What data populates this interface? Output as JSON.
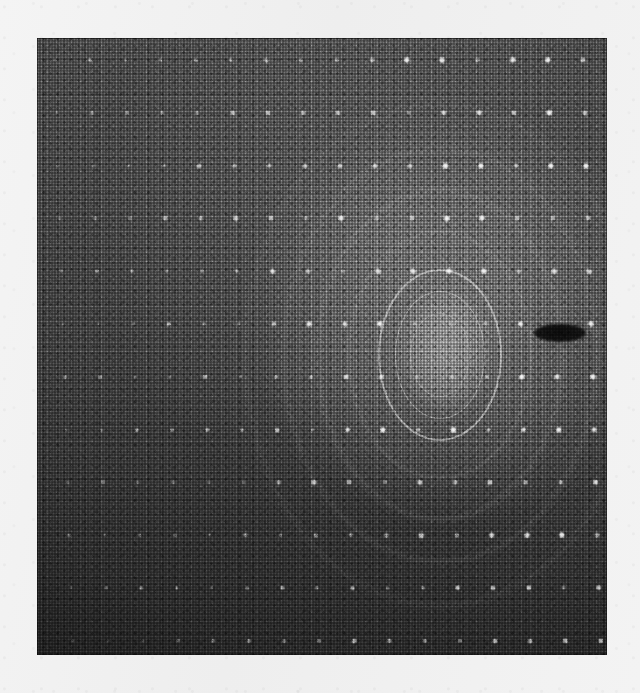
{
  "page": {
    "width": 640,
    "height": 693,
    "background_color": "#f1f1f1",
    "kind": "scanned-figure"
  },
  "figure": {
    "title": "",
    "caption": "",
    "panel": {
      "name": "detector-image",
      "left": 37,
      "top": 38,
      "width": 570,
      "height": 617,
      "background_color": "#3a3a3a"
    }
  },
  "chart_data": {
    "type": "heatmap",
    "title": "",
    "subtitle": "",
    "xlabel": "",
    "ylabel": "",
    "grid": false,
    "legend": null,
    "colormap": "grayscale",
    "intensity_range": [
      0,
      255
    ],
    "background": {
      "name": "detector-noise-field",
      "mean_level": 62,
      "noise_amplitude": 34,
      "gradient": "brighter toward upper-right beam region, darker toward bottom-left"
    },
    "beam_center": {
      "x": 440,
      "y": 355
    },
    "rings": [
      {
        "name": "ring-outer-bright",
        "cx": 440,
        "cy": 355,
        "rx": 62,
        "ry": 86,
        "width": 2.0,
        "opacity": 0.42
      },
      {
        "name": "ring-inner-bright",
        "cx": 440,
        "cy": 355,
        "rx": 45,
        "ry": 64,
        "width": 1.6,
        "opacity": 0.3
      },
      {
        "name": "ring-inner-faint",
        "cx": 440,
        "cy": 355,
        "rx": 30,
        "ry": 42,
        "width": 1.2,
        "opacity": 0.18
      }
    ],
    "outer_arcs": [
      {
        "name": "arc-1",
        "cx": 440,
        "cy": 355,
        "rx": 92,
        "ry": 124,
        "width": 2.5,
        "opacity": 0.13
      },
      {
        "name": "arc-2",
        "cx": 440,
        "cy": 355,
        "rx": 124,
        "ry": 166,
        "width": 3.0,
        "opacity": 0.11
      },
      {
        "name": "arc-3",
        "cx": 440,
        "cy": 355,
        "rx": 158,
        "ry": 208,
        "width": 3.0,
        "opacity": 0.09
      },
      {
        "name": "arc-4",
        "cx": 440,
        "cy": 355,
        "rx": 196,
        "ry": 252,
        "width": 3.5,
        "opacity": 0.07
      }
    ],
    "central_halo": {
      "cx": 445,
      "cy": 352,
      "rx": 44,
      "ry": 60,
      "peak_opacity": 0.26
    },
    "beam_stop": {
      "name": "beam-stop-shadow",
      "cx": 560,
      "cy": 333,
      "rx": 26,
      "ry": 9,
      "fill": "#111111"
    },
    "spot_lattice": {
      "origin_x": 55,
      "origin_y": 60,
      "spacing_x": 35.2,
      "spacing_y": 52.8,
      "shear_per_row": 1.6,
      "columns": 17,
      "rows": 12,
      "base_size": 5.0,
      "note": "Bright reflections fade toward the dark lower-left and are partly washed out inside the bright halo."
    },
    "streaks": [
      {
        "name": "streak-1",
        "x": 278,
        "y": 338,
        "length": 110,
        "thickness": 2,
        "opacity": 0.26
      },
      {
        "name": "streak-2",
        "x": 300,
        "y": 349,
        "length": 96,
        "thickness": 1.5,
        "opacity": 0.2
      },
      {
        "name": "streak-3",
        "x": 262,
        "y": 368,
        "length": 120,
        "thickness": 1.5,
        "opacity": 0.16
      },
      {
        "name": "streak-4",
        "x": 320,
        "y": 312,
        "length": 80,
        "thickness": 1.5,
        "opacity": 0.14
      }
    ]
  },
  "colors": {
    "paper": "#f1f1f1",
    "detector_dark": "#262626",
    "detector_mid": "#4a4a4a",
    "detector_bright": "#8e8e8e",
    "spot_white": "#ffffff",
    "beam_stop": "#111111"
  }
}
